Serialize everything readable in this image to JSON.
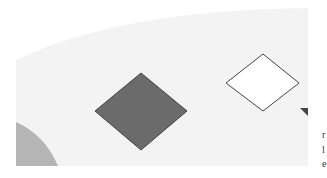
{
  "figure": {
    "background_color": "#f3f3f3",
    "shapes": [
      {
        "name": "filled-diamond",
        "fill": "#6b6b6b",
        "stroke": "#444444"
      },
      {
        "name": "outline-diamond",
        "fill": "#ffffff",
        "stroke": "#444444"
      },
      {
        "name": "corner-wedge",
        "fill": "#b5b5b5"
      },
      {
        "name": "arrow-head",
        "fill": "#444444"
      }
    ]
  },
  "side_text": {
    "line1": "r",
    "line2": "l",
    "line3": "e"
  }
}
